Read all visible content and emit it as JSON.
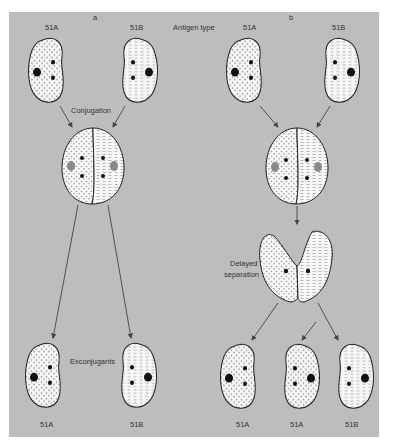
{
  "figure": {
    "panels": [
      {
        "id": "a",
        "label": "a"
      },
      {
        "id": "b",
        "label": "b"
      }
    ],
    "header_label": "Antigen type",
    "colors": {
      "background": "#bdbdbd",
      "cell_fill": "#f7f7f7",
      "outline": "#222222",
      "nucleus": "#111111",
      "faded_nucleus": "#8a8a8a"
    },
    "panel_a": {
      "parents": [
        "51A",
        "51B"
      ],
      "stage1": "Conjugation",
      "stage2": "Exconjugants",
      "offspring": [
        "51A",
        "51B"
      ]
    },
    "panel_b": {
      "parents": [
        "51A",
        "51B"
      ],
      "stage": "Delayed separation",
      "stage_line1": "Delayed",
      "stage_line2": "separation",
      "offspring": [
        "51A",
        "51A",
        "51B"
      ]
    }
  }
}
